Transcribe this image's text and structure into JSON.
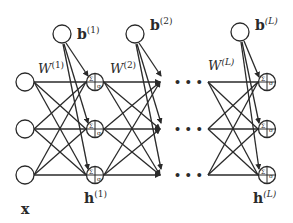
{
  "diagram": {
    "type": "feedforward-neural-network",
    "colors": {
      "stroke": "#2a2a2a",
      "background": "#ffffff"
    },
    "labels": {
      "input": {
        "base": "x"
      },
      "bias_1": {
        "base": "b",
        "sup": "(1)"
      },
      "bias_2": {
        "base": "b",
        "sup": "(2)"
      },
      "bias_L": {
        "base": "b",
        "sup": "(L)"
      },
      "weight_1": {
        "base": "W",
        "sup": "(1)"
      },
      "weight_2": {
        "base": "W",
        "sup": "(2)"
      },
      "weight_L": {
        "base": "W",
        "sup": "(L)"
      },
      "hidden_1": {
        "base": "h",
        "sup": "(1)"
      },
      "hidden_L": {
        "base": "h",
        "sup": "(L)"
      },
      "ellipsis": "• • •",
      "activation": "σ",
      "sum": "Σ"
    },
    "layers": [
      {
        "name": "input",
        "nodes": 3
      },
      {
        "name": "hidden-1",
        "nodes": 3
      },
      {
        "name": "hidden-L",
        "nodes": 3
      }
    ]
  }
}
